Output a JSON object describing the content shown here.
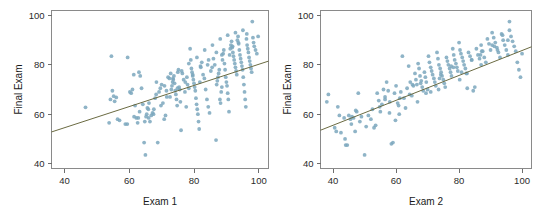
{
  "figure": {
    "width": 551,
    "height": 220,
    "background": "#ffffff"
  },
  "style": {
    "point_color": "#7ba7bd",
    "point_opacity": 0.85,
    "point_radius": 1.9,
    "line_color": "#6b6b42",
    "axis_color": "#6e6e6e",
    "frame_color": "#8a8a8a",
    "text_color": "#1a1a1a"
  },
  "chart_data": [
    {
      "type": "scatter",
      "panel": "left",
      "title": "",
      "xlabel": "Exam 1",
      "ylabel": "Final Exam",
      "xlim": [
        36,
        103
      ],
      "ylim": [
        38,
        102
      ],
      "xticks": [
        40,
        60,
        80,
        100
      ],
      "yticks": [
        40,
        60,
        80,
        100
      ],
      "grid": false,
      "legend": "none",
      "trendline": {
        "type": "linear",
        "x_start": 36,
        "y_start": 52.8,
        "x_end": 103,
        "y_end": 81.5
      },
      "x": [
        46.5,
        53.8,
        54.2,
        54.5,
        54.8,
        55.2,
        55.5,
        56.0,
        56.4,
        57.0,
        58.8,
        59.5,
        60.2,
        60.6,
        61.0,
        61.4,
        61.8,
        62.2,
        62.6,
        63.0,
        63.4,
        63.8,
        64.2,
        64.6,
        65.0,
        65.2,
        65.4,
        65.6,
        66.0,
        66.4,
        66.8,
        67.2,
        67.6,
        68.0,
        68.4,
        68.8,
        69.2,
        69.6,
        70.0,
        70.4,
        70.8,
        71.2,
        71.6,
        72.0,
        72.4,
        72.8,
        73.0,
        73.2,
        73.4,
        73.6,
        73.8,
        74.0,
        74.2,
        74.4,
        74.6,
        74.8,
        75.0,
        75.2,
        75.4,
        75.6,
        75.8,
        76.0,
        76.4,
        76.8,
        77.2,
        77.6,
        78.0,
        78.4,
        78.8,
        79.0,
        79.2,
        79.4,
        79.6,
        79.8,
        80.0,
        80.2,
        80.4,
        80.6,
        80.8,
        81.0,
        81.2,
        81.4,
        81.6,
        81.8,
        82.0,
        82.4,
        82.8,
        83.2,
        83.6,
        84.0,
        84.4,
        84.8,
        85.2,
        85.6,
        86.0,
        86.4,
        86.8,
        87.0,
        87.2,
        87.4,
        87.6,
        87.8,
        88.0,
        88.2,
        88.4,
        88.6,
        88.8,
        89.0,
        89.2,
        89.4,
        89.6,
        89.8,
        90.0,
        90.2,
        90.4,
        90.6,
        90.8,
        91.0,
        91.2,
        91.4,
        91.6,
        91.8,
        92.0,
        92.2,
        92.4,
        92.6,
        92.8,
        93.0,
        93.2,
        93.4,
        93.6,
        93.8,
        94.0,
        94.2,
        94.4,
        94.6,
        94.8,
        95.0,
        95.2,
        95.4,
        95.6,
        95.8,
        96.0,
        96.2,
        96.4,
        96.6,
        96.8,
        97.0,
        97.2,
        97.4,
        97.6,
        97.8,
        98.0,
        98.2,
        98.4,
        98.6,
        99.0,
        99.4,
        99.8,
        64.8,
        67.5,
        69.8,
        72.6,
        74.9,
        77.3,
        79.6,
        82.1,
        84.5,
        86.9,
        61.5,
        63.2,
        66.1,
        68.3,
        70.9,
        73.5,
        76.2,
        78.4,
        80.9,
        83.3,
        85.7,
        88.1,
        90.4,
        92.8,
        95.1,
        59.4,
        62.8,
        65.9,
        71.5,
        77.8,
        84.2,
        88.6,
        91.9,
        93.7,
        96.3
      ],
      "y": [
        62.8,
        56.5,
        66.0,
        83.5,
        69.5,
        67.3,
        65.2,
        66.8,
        58.0,
        57.5,
        56.0,
        83.0,
        69.0,
        68.5,
        70.0,
        76.0,
        63.5,
        58.5,
        56.5,
        77.0,
        75.5,
        70.5,
        64.0,
        48.5,
        43.5,
        59.0,
        60.0,
        62.5,
        58.5,
        57.0,
        59.5,
        60.5,
        62.0,
        66.5,
        73.0,
        48.5,
        69.0,
        70.5,
        72.0,
        64.5,
        58.0,
        59.5,
        67.0,
        75.0,
        74.5,
        76.5,
        70.0,
        71.5,
        73.0,
        74.0,
        75.5,
        72.5,
        69.5,
        68.0,
        66.0,
        63.5,
        77.0,
        78.0,
        71.0,
        70.0,
        65.0,
        53.5,
        76.5,
        74.0,
        69.0,
        63.0,
        72.0,
        70.5,
        86.5,
        82.0,
        78.5,
        77.0,
        75.5,
        74.0,
        72.5,
        71.0,
        69.5,
        66.5,
        64.0,
        62.0,
        60.0,
        57.0,
        54.0,
        73.0,
        79.5,
        81.0,
        76.0,
        74.5,
        70.0,
        66.0,
        63.0,
        60.5,
        77.5,
        79.0,
        82.5,
        80.0,
        49.5,
        72.0,
        73.5,
        75.0,
        76.5,
        78.0,
        66.0,
        64.5,
        69.0,
        71.0,
        82.0,
        84.5,
        86.0,
        80.5,
        78.0,
        75.0,
        73.0,
        71.5,
        68.5,
        66.0,
        61.0,
        84.0,
        86.5,
        88.0,
        89.5,
        87.0,
        85.0,
        83.5,
        82.0,
        80.5,
        79.0,
        77.5,
        76.0,
        90.0,
        91.5,
        88.5,
        86.0,
        84.0,
        82.5,
        81.0,
        79.5,
        78.0,
        75.0,
        72.0,
        69.0,
        66.0,
        63.0,
        90.5,
        88.0,
        86.5,
        85.0,
        83.0,
        81.5,
        80.0,
        78.5,
        77.0,
        97.5,
        91.0,
        89.0,
        87.5,
        86.0,
        84.5,
        91.5,
        57.0,
        60.0,
        63.5,
        67.0,
        70.5,
        73.0,
        76.0,
        79.0,
        82.0,
        85.0,
        59.0,
        61.0,
        64.5,
        68.0,
        71.5,
        74.5,
        77.5,
        80.5,
        83.0,
        86.0,
        88.0,
        90.5,
        92.0,
        93.0,
        94.0,
        56.0,
        58.5,
        62.0,
        69.5,
        75.0,
        80.0,
        84.0,
        87.5,
        89.0,
        92.5
      ]
    },
    {
      "type": "scatter",
      "panel": "right",
      "title": "",
      "xlabel": "Exam 2",
      "ylabel": "Final Exam",
      "xlim": [
        36,
        103
      ],
      "ylim": [
        38,
        102
      ],
      "xticks": [
        40,
        60,
        80,
        100
      ],
      "yticks": [
        40,
        60,
        80,
        100
      ],
      "grid": false,
      "legend": "none",
      "trendline": {
        "type": "linear",
        "x_start": 36,
        "y_start": 53.5,
        "x_end": 103,
        "y_end": 87.3
      },
      "x": [
        38.0,
        38.5,
        40.5,
        41.0,
        41.5,
        42.0,
        43.5,
        44.0,
        44.5,
        45.0,
        45.5,
        46.0,
        46.5,
        47.0,
        47.5,
        48.0,
        49.0,
        50.0,
        50.5,
        52.5,
        53.0,
        53.5,
        54.0,
        54.5,
        55.0,
        55.5,
        56.0,
        56.5,
        57.0,
        57.5,
        58.0,
        58.5,
        59.0,
        59.5,
        60.0,
        60.5,
        61.0,
        61.5,
        62.0,
        62.5,
        63.0,
        63.5,
        64.0,
        64.5,
        65.0,
        65.5,
        66.0,
        66.3,
        66.6,
        67.0,
        67.3,
        67.6,
        68.0,
        68.3,
        68.6,
        69.0,
        69.3,
        69.6,
        70.0,
        70.3,
        70.6,
        71.0,
        71.3,
        71.6,
        72.0,
        72.3,
        72.6,
        73.0,
        73.3,
        73.6,
        74.0,
        74.3,
        74.6,
        75.0,
        75.3,
        75.6,
        76.0,
        76.3,
        76.6,
        77.0,
        77.3,
        77.6,
        78.0,
        78.3,
        78.6,
        79.0,
        79.3,
        79.6,
        80.0,
        80.3,
        80.6,
        81.0,
        81.3,
        81.6,
        82.0,
        82.3,
        82.6,
        83.0,
        83.5,
        84.0,
        84.5,
        85.0,
        85.5,
        86.0,
        86.5,
        87.0,
        87.5,
        88.0,
        88.5,
        89.0,
        89.5,
        90.0,
        90.5,
        91.0,
        91.5,
        92.0,
        92.5,
        93.0,
        93.5,
        94.0,
        94.5,
        95.0,
        95.5,
        96.0,
        96.5,
        97.0,
        97.5,
        98.0,
        98.5,
        99.0,
        99.5,
        100.0,
        42.5,
        45.8,
        48.5,
        51.2,
        54.8,
        57.9,
        61.2,
        64.3,
        67.8,
        71.0,
        74.2,
        77.5,
        80.8,
        84.0,
        87.2,
        90.5,
        93.8,
        96.0,
        43.8,
        47.2,
        52.0,
        56.5,
        60.8,
        65.2,
        69.5,
        73.8,
        78.2,
        82.5,
        86.8,
        91.2,
        95.5,
        59.8,
        66.8,
        73.5,
        80.2,
        87.0,
        92.2
      ],
      "y": [
        65.0,
        68.0,
        54.5,
        53.0,
        63.0,
        59.5,
        58.5,
        47.5,
        47.5,
        59.5,
        58.0,
        59.0,
        58.5,
        53.0,
        61.0,
        68.5,
        59.0,
        43.5,
        55.0,
        62.0,
        54.5,
        55.5,
        68.5,
        65.5,
        61.0,
        64.0,
        70.0,
        67.0,
        73.0,
        69.5,
        65.0,
        48.0,
        48.5,
        68.5,
        71.5,
        64.5,
        60.0,
        69.0,
        83.5,
        66.5,
        62.5,
        70.5,
        79.5,
        73.0,
        67.5,
        71.5,
        76.5,
        74.0,
        72.0,
        80.5,
        78.5,
        75.5,
        73.5,
        71.0,
        69.5,
        77.0,
        75.0,
        73.0,
        70.0,
        83.5,
        81.0,
        79.0,
        77.5,
        76.0,
        74.5,
        73.0,
        71.5,
        85.0,
        82.5,
        80.0,
        78.5,
        77.0,
        75.5,
        74.0,
        72.5,
        71.0,
        83.0,
        81.5,
        80.0,
        78.5,
        77.0,
        75.5,
        86.5,
        84.0,
        82.0,
        80.5,
        79.0,
        77.5,
        89.0,
        86.0,
        84.5,
        83.0,
        81.5,
        80.0,
        78.5,
        76.5,
        70.5,
        85.0,
        83.5,
        82.0,
        69.5,
        71.0,
        86.5,
        84.0,
        82.5,
        88.0,
        85.5,
        83.0,
        81.0,
        90.5,
        88.5,
        86.0,
        93.0,
        91.0,
        89.0,
        87.0,
        85.0,
        83.0,
        92.5,
        90.0,
        88.0,
        86.0,
        84.0,
        97.5,
        91.5,
        89.5,
        87.5,
        85.5,
        81.0,
        78.0,
        75.0,
        84.5,
        52.5,
        56.0,
        57.0,
        59.5,
        63.0,
        60.5,
        66.5,
        68.0,
        72.5,
        69.0,
        76.0,
        79.5,
        77.0,
        82.0,
        85.5,
        88.0,
        92.0,
        94.0,
        50.0,
        61.5,
        58.0,
        66.0,
        63.5,
        72.0,
        68.5,
        74.5,
        79.0,
        76.5,
        84.0,
        87.5,
        90.0,
        57.5,
        65.0,
        70.0,
        74.0,
        80.0,
        86.0
      ]
    }
  ]
}
